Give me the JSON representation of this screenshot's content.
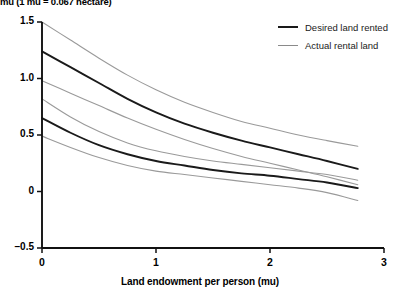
{
  "note": "mu (1 mu = 0.067 hectare)",
  "legend": {
    "items": [
      {
        "label": "Desired land rented",
        "color": "#1a1a1a",
        "style": "solid-black"
      },
      {
        "label": "Actual rental land",
        "color": "#8a8a8a",
        "style": "solid-gray"
      }
    ]
  },
  "axes": {
    "x_label": "Land endowment per person (mu)",
    "y_label": "",
    "x_ticks": [
      "0",
      "1",
      "2",
      "3"
    ],
    "y_ticks": [
      "1.5",
      "1.0",
      "0.5",
      "0",
      "–0.5"
    ]
  },
  "chart_data": {
    "type": "line",
    "title": "",
    "subtitle": "",
    "annotations": [
      "mu (1 mu = 0.067 hectare)"
    ],
    "xlabel": "Land endowment per person (mu)",
    "ylabel": "",
    "xlim": [
      0,
      3
    ],
    "ylim": [
      -0.5,
      1.5
    ],
    "xticks": [
      0,
      1,
      2,
      3
    ],
    "yticks": [
      -0.5,
      0,
      0.5,
      1.0,
      1.5
    ],
    "grid": false,
    "legend_position": "top-right",
    "x": [
      0.0,
      0.25,
      0.5,
      0.75,
      1.0,
      1.25,
      1.5,
      1.75,
      2.0,
      2.25,
      2.5,
      2.77
    ],
    "series": [
      {
        "name": "Desired land rented",
        "role": "mean",
        "color": "#1a1a1a",
        "values": [
          1.24,
          1.1,
          0.96,
          0.82,
          0.7,
          0.6,
          0.52,
          0.45,
          0.39,
          0.33,
          0.27,
          0.2
        ]
      },
      {
        "name": "Desired land rented upper CI",
        "role": "upper-ci",
        "color": "#9a9a9a",
        "values": [
          1.5,
          1.34,
          1.18,
          1.03,
          0.9,
          0.79,
          0.7,
          0.62,
          0.56,
          0.5,
          0.45,
          0.4
        ]
      },
      {
        "name": "Desired land rented lower CI",
        "role": "lower-ci",
        "color": "#9a9a9a",
        "values": [
          0.98,
          0.87,
          0.76,
          0.65,
          0.55,
          0.46,
          0.38,
          0.31,
          0.25,
          0.19,
          0.13,
          0.06
        ]
      },
      {
        "name": "Actual rental land",
        "role": "mean",
        "color": "#1a1a1a",
        "values": [
          0.65,
          0.52,
          0.41,
          0.33,
          0.27,
          0.23,
          0.19,
          0.16,
          0.14,
          0.11,
          0.08,
          0.03
        ]
      },
      {
        "name": "Actual rental land upper CI",
        "role": "upper-ci",
        "color": "#9a9a9a",
        "values": [
          0.82,
          0.66,
          0.53,
          0.43,
          0.36,
          0.31,
          0.27,
          0.24,
          0.21,
          0.18,
          0.15,
          0.1
        ]
      },
      {
        "name": "Actual rental land lower CI",
        "role": "lower-ci",
        "color": "#9a9a9a",
        "values": [
          0.49,
          0.39,
          0.3,
          0.23,
          0.18,
          0.15,
          0.12,
          0.09,
          0.06,
          0.03,
          -0.01,
          -0.08
        ]
      }
    ]
  }
}
